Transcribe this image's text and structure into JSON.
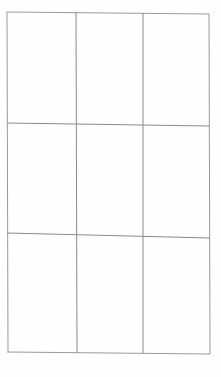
{
  "diagram": {
    "type": "empty-grid",
    "rows": 3,
    "columns": 3,
    "line_color": "#8a8a8a",
    "background": "#fefefe",
    "cells": [
      [
        "",
        "",
        ""
      ],
      [
        "",
        "",
        ""
      ],
      [
        "",
        "",
        ""
      ]
    ]
  }
}
